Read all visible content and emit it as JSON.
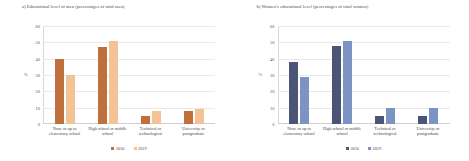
{
  "panels": [
    {
      "title": "a) Educational level of men (percentages of total men)",
      "ylabel": "%",
      "series_colors": {
        "s2010": "#C0703C",
        "s2019": "#F4C395"
      }
    },
    {
      "title": "b) Women's educational level (percentages of total women)",
      "ylabel": "%",
      "series_colors": {
        "s2010": "#4A5578",
        "s2019": "#7B94C4"
      }
    }
  ],
  "yticks": [
    "60",
    "50",
    "40",
    "30",
    "20",
    "10",
    "0"
  ],
  "legend": [
    {
      "label": "2010"
    },
    {
      "label": "2019"
    }
  ],
  "chart_data": [
    {
      "type": "bar",
      "title": "a) Educational level of men (percentages of total men)",
      "xlabel": "",
      "ylabel": "%",
      "ylim": [
        0,
        60
      ],
      "yticks": [
        0,
        10,
        20,
        30,
        40,
        50,
        60
      ],
      "grid": true,
      "legend_position": "bottom",
      "categories": [
        "None or up to elementary school",
        "High school or middle school",
        "Technical or technological",
        "University or postgraduate"
      ],
      "series": [
        {
          "name": "2010",
          "color": "#C0703C",
          "values": [
            40,
            47,
            5,
            8
          ]
        },
        {
          "name": "2019",
          "color": "#F4C395",
          "values": [
            30,
            51,
            8,
            9
          ]
        }
      ]
    },
    {
      "type": "bar",
      "title": "b) Women's educational level (percentages of total women)",
      "xlabel": "",
      "ylabel": "%",
      "ylim": [
        0,
        60
      ],
      "yticks": [
        0,
        10,
        20,
        30,
        40,
        50,
        60
      ],
      "grid": true,
      "legend_position": "bottom",
      "categories": [
        "None or up to elementary school",
        "High school or middle school",
        "Technical or technological",
        "University or postgraduate"
      ],
      "series": [
        {
          "name": "2010",
          "color": "#4A5578",
          "values": [
            38,
            48,
            5,
            5
          ]
        },
        {
          "name": "2019",
          "color": "#7B94C4",
          "values": [
            29,
            51,
            10,
            10
          ]
        }
      ]
    }
  ]
}
